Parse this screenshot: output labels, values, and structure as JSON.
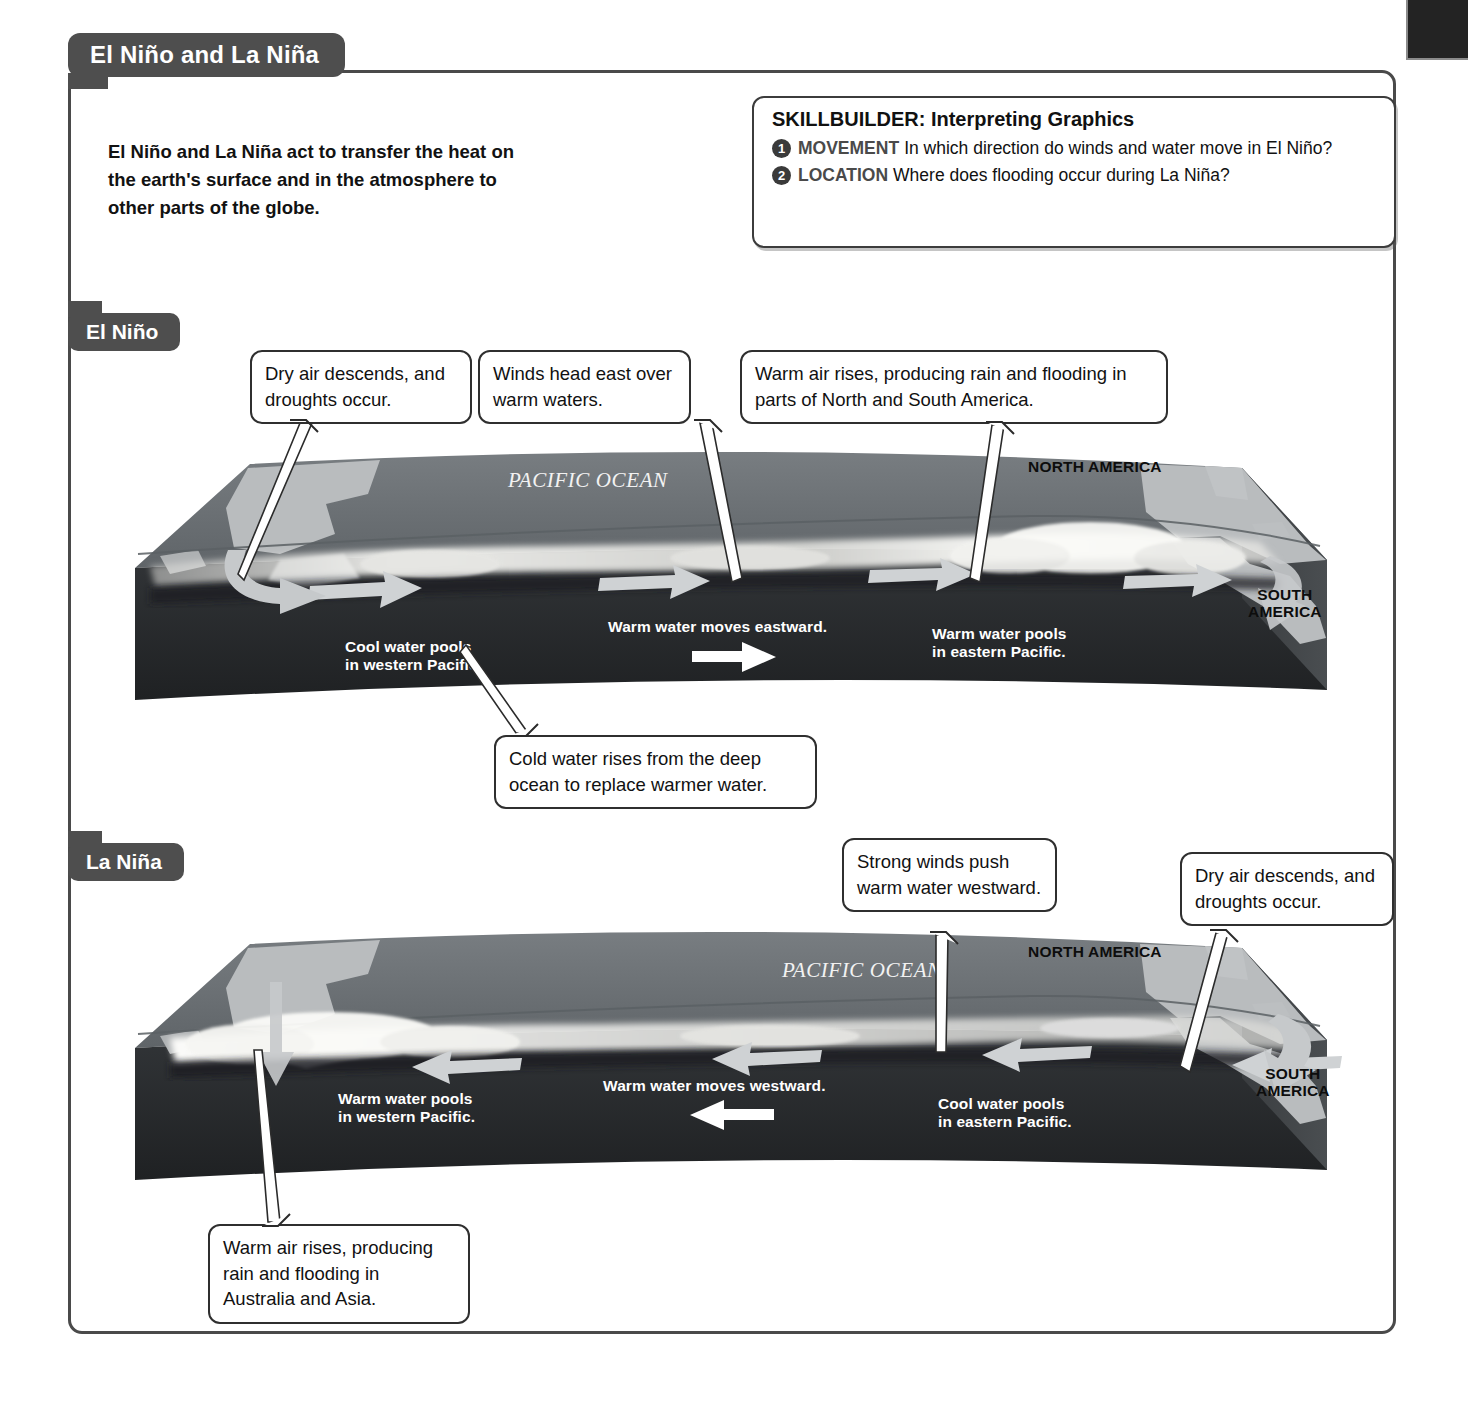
{
  "page": {
    "title": "El Niño and La Niña",
    "intro": "El Niño and La Niña act to transfer the heat on the earth's surface and in the atmosphere to other parts of the globe."
  },
  "skillbuilder": {
    "title": "SKILLBUILDER: Interpreting Graphics",
    "questions": [
      {
        "num": "1",
        "keyword": "MOVEMENT",
        "text": "In which direction do winds and water move in El Niño?"
      },
      {
        "num": "2",
        "keyword": "LOCATION",
        "text": "Where does flooding occur during La Niña?"
      }
    ]
  },
  "sections": [
    {
      "id": "el-nino",
      "label": "El Niño",
      "callouts": [
        {
          "name": "dry-air-descends",
          "text": "Dry air descends, and droughts occur."
        },
        {
          "name": "winds-head-east",
          "text": "Winds head east over warm waters."
        },
        {
          "name": "warm-air-rises-americas",
          "text": "Warm air rises, producing rain and flooding in parts of North and South America."
        },
        {
          "name": "cold-water-rises",
          "text": "Cold water rises from the deep ocean to replace warmer water."
        }
      ],
      "map_labels": {
        "ocean": "PACIFIC OCEAN",
        "north_america": "NORTH AMERICA",
        "south_america": "SOUTH AMERICA",
        "west_pool": "Cool water pools in western Pacific.",
        "east_pool": "Warm water pools in eastern Pacific.",
        "flow": "Warm water moves eastward.",
        "flow_direction": "east"
      }
    },
    {
      "id": "la-nina",
      "label": "La Niña",
      "callouts": [
        {
          "name": "strong-winds-push",
          "text": "Strong winds push warm water westward."
        },
        {
          "name": "dry-air-descends",
          "text": "Dry air descends, and droughts occur."
        },
        {
          "name": "warm-air-rises-australia",
          "text": "Warm air rises, producing rain and flooding in Australia and Asia."
        }
      ],
      "map_labels": {
        "ocean": "PACIFIC OCEAN",
        "north_america": "NORTH AMERICA",
        "south_america": "SOUTH AMERICA",
        "west_pool": "Warm water pools in western Pacific.",
        "east_pool": "Cool water pools in eastern Pacific.",
        "flow": "Warm water moves westward.",
        "flow_direction": "west"
      }
    }
  ],
  "colors": {
    "frame": "#4a4a4a",
    "pill": "#4e4e4e",
    "ocean_top": "#6f7478",
    "ocean_deep": "#2b2d2f",
    "land": "#b9bcbe",
    "cloud": "#f0f0ee",
    "corner_tab": "#232323"
  }
}
